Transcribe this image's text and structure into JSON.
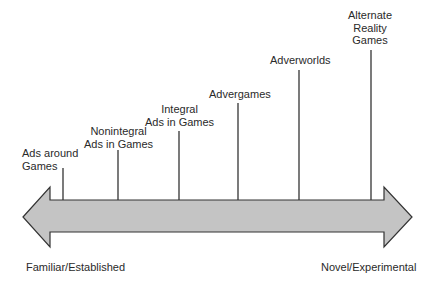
{
  "diagram": {
    "type": "continuum",
    "arrow_fill": "#c4c4c4",
    "stroke": "#333333",
    "stages": [
      {
        "lines": [
          "Ads around",
          "Games"
        ],
        "x": 63,
        "top": 168
      },
      {
        "lines": [
          "Nonintegral",
          "Ads in Games"
        ],
        "x": 118,
        "top": 150
      },
      {
        "lines": [
          "Integral",
          "Ads in Games"
        ],
        "x": 179,
        "top": 131
      },
      {
        "lines": [
          "Advergames"
        ],
        "x": 238,
        "top": 103
      },
      {
        "lines": [
          "Adverworlds"
        ],
        "x": 299,
        "top": 70
      },
      {
        "lines": [
          "Alternate",
          "Reality",
          "Games"
        ],
        "x": 371,
        "top": 50
      }
    ],
    "left_end_label": "Familiar/Established",
    "right_end_label": "Novel/Experimental"
  }
}
